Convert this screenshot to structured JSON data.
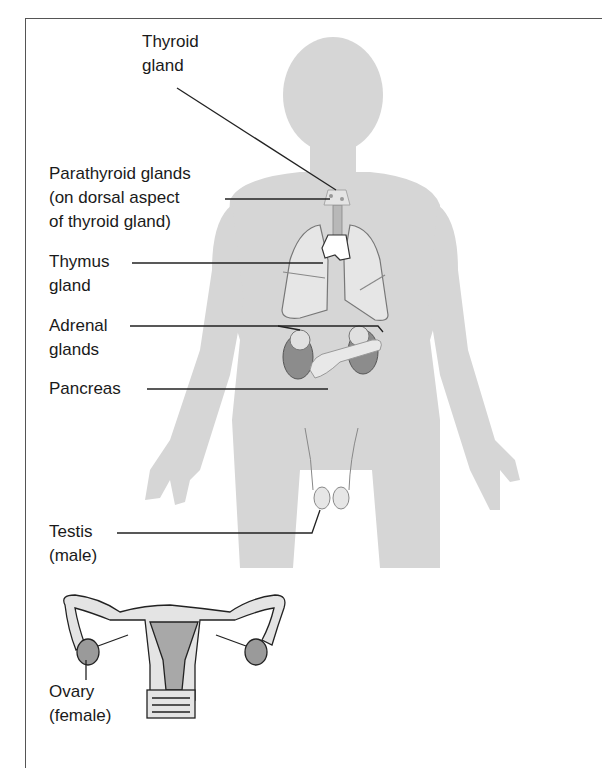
{
  "figure": {
    "labels": {
      "thyroid": "Thyroid\ngland",
      "parathyroid": "Parathyroid glands\n(on dorsal aspect\nof thyroid gland)",
      "thymus": "Thymus\ngland",
      "adrenal": "Adrenal\nglands",
      "pancreas": "Pancreas",
      "testis": "Testis\n(male)",
      "ovary": "Ovary\n(female)"
    },
    "colors": {
      "body_fill": "#d6d6d6",
      "organ_fill": "#e8e8e8",
      "organ_dark": "#8c8c8c",
      "leader_line": "#222222",
      "frame": "#555555"
    }
  }
}
